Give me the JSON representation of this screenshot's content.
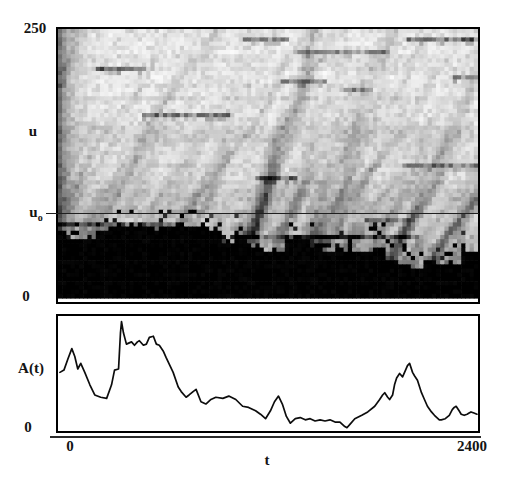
{
  "figure": {
    "paper_color": "#ffffff",
    "ink_color": "#141414"
  },
  "heatmap_panel": {
    "y_max_label": "250",
    "y_axis_label": "u",
    "ref_label_base": "u",
    "ref_label_sub": "o",
    "y_min_label": "0"
  },
  "timeseries_panel": {
    "y_axis_label": "A(t)",
    "y_min_label": "0"
  },
  "x_axis": {
    "min_label": "0",
    "max_label": "2400",
    "label": "t"
  },
  "chart_data": [
    {
      "type": "heatmap",
      "title": "",
      "xlabel": "t",
      "ylabel": "u",
      "x_range": [
        0,
        2400
      ],
      "y_range": [
        0,
        250
      ],
      "y_tick_labels": [
        "0",
        "250"
      ],
      "colormap": "grayscale, dark = high amplitude",
      "reference_line": {
        "label": "u_o",
        "u": 81
      },
      "description": "Space-time grayscale intensity plot of u versus t. A solid black band with a jagged upper boundary runs along the bottom (u near 0). Above it, gray diagonal streaks propagate up and to the right, fading toward large u; scattered short horizontal dark streaks appear throughout. A thin horizontal reference line marks u_o about one third of the way up.",
      "texture": {
        "seed": 20,
        "cols": 100,
        "rows": 64,
        "bottom_margin_px": 4,
        "base_gray": 0.06,
        "noise": 0.13,
        "row_banding": 0.07,
        "bottom_gradient": 0.22,
        "left_edge": 0.42,
        "diagonal_streaks": {
          "count": 62,
          "slope_cols_per_row": [
            0.3,
            0.75
          ],
          "intensity": [
            0.1,
            0.45
          ],
          "decay_rows": [
            12,
            48
          ]
        },
        "horizontal_streaks": {
          "count": 14,
          "length_cols": [
            8,
            34
          ],
          "intensity": [
            0.2,
            0.5
          ]
        },
        "bottom_band": {
          "min_rows": 6,
          "max_rows": 17
        }
      }
    },
    {
      "type": "line",
      "title": "",
      "xlabel": "t",
      "ylabel": "A(t)",
      "x_range": [
        0,
        2400
      ],
      "y_range": [
        0,
        1
      ],
      "x_tick_labels": [
        "0",
        "2400"
      ],
      "y_tick_labels": [
        "0"
      ],
      "line_color": "#0d0d0d",
      "points": [
        [
          11,
          0.51
        ],
        [
          34,
          0.53
        ],
        [
          57,
          0.63
        ],
        [
          79,
          0.72
        ],
        [
          96,
          0.65
        ],
        [
          113,
          0.54
        ],
        [
          130,
          0.59
        ],
        [
          153,
          0.51
        ],
        [
          182,
          0.4
        ],
        [
          210,
          0.31
        ],
        [
          244,
          0.29
        ],
        [
          278,
          0.28
        ],
        [
          306,
          0.4
        ],
        [
          323,
          0.53
        ],
        [
          346,
          0.54
        ],
        [
          357,
          0.86
        ],
        [
          363,
          0.96
        ],
        [
          374,
          0.86
        ],
        [
          391,
          0.76
        ],
        [
          420,
          0.78
        ],
        [
          437,
          0.75
        ],
        [
          454,
          0.78
        ],
        [
          465,
          0.79
        ],
        [
          488,
          0.75
        ],
        [
          505,
          0.76
        ],
        [
          522,
          0.82
        ],
        [
          545,
          0.83
        ],
        [
          562,
          0.76
        ],
        [
          579,
          0.75
        ],
        [
          601,
          0.7
        ],
        [
          618,
          0.64
        ],
        [
          658,
          0.51
        ],
        [
          687,
          0.38
        ],
        [
          704,
          0.34
        ],
        [
          732,
          0.29
        ],
        [
          749,
          0.31
        ],
        [
          772,
          0.34
        ],
        [
          789,
          0.36
        ],
        [
          817,
          0.25
        ],
        [
          845,
          0.23
        ],
        [
          874,
          0.27
        ],
        [
          902,
          0.29
        ],
        [
          942,
          0.28
        ],
        [
          976,
          0.3
        ],
        [
          1016,
          0.27
        ],
        [
          1055,
          0.21
        ],
        [
          1089,
          0.2
        ],
        [
          1129,
          0.17
        ],
        [
          1157,
          0.14
        ],
        [
          1186,
          0.1
        ],
        [
          1214,
          0.17
        ],
        [
          1237,
          0.25
        ],
        [
          1260,
          0.3
        ],
        [
          1282,
          0.23
        ],
        [
          1305,
          0.12
        ],
        [
          1328,
          0.06
        ],
        [
          1356,
          0.1
        ],
        [
          1384,
          0.11
        ],
        [
          1413,
          0.09
        ],
        [
          1441,
          0.1
        ],
        [
          1469,
          0.08
        ],
        [
          1498,
          0.09
        ],
        [
          1526,
          0.08
        ],
        [
          1554,
          0.09
        ],
        [
          1583,
          0.07
        ],
        [
          1611,
          0.07
        ],
        [
          1639,
          0.03
        ],
        [
          1651,
          0.02
        ],
        [
          1668,
          0.05
        ],
        [
          1696,
          0.1
        ],
        [
          1736,
          0.13
        ],
        [
          1770,
          0.16
        ],
        [
          1810,
          0.21
        ],
        [
          1838,
          0.27
        ],
        [
          1855,
          0.31
        ],
        [
          1867,
          0.33
        ],
        [
          1884,
          0.29
        ],
        [
          1895,
          0.27
        ],
        [
          1912,
          0.31
        ],
        [
          1923,
          0.4
        ],
        [
          1935,
          0.46
        ],
        [
          1952,
          0.5
        ],
        [
          1969,
          0.47
        ],
        [
          1986,
          0.53
        ],
        [
          1997,
          0.57
        ],
        [
          2009,
          0.59
        ],
        [
          2026,
          0.51
        ],
        [
          2037,
          0.48
        ],
        [
          2054,
          0.44
        ],
        [
          2077,
          0.33
        ],
        [
          2094,
          0.27
        ],
        [
          2111,
          0.21
        ],
        [
          2134,
          0.16
        ],
        [
          2151,
          0.13
        ],
        [
          2179,
          0.09
        ],
        [
          2190,
          0.09
        ],
        [
          2213,
          0.1
        ],
        [
          2236,
          0.13
        ],
        [
          2253,
          0.18
        ],
        [
          2264,
          0.2
        ],
        [
          2275,
          0.21
        ],
        [
          2292,
          0.17
        ],
        [
          2304,
          0.14
        ],
        [
          2321,
          0.13
        ],
        [
          2338,
          0.14
        ],
        [
          2349,
          0.15
        ],
        [
          2360,
          0.16
        ],
        [
          2377,
          0.15
        ],
        [
          2394,
          0.14
        ]
      ]
    }
  ]
}
